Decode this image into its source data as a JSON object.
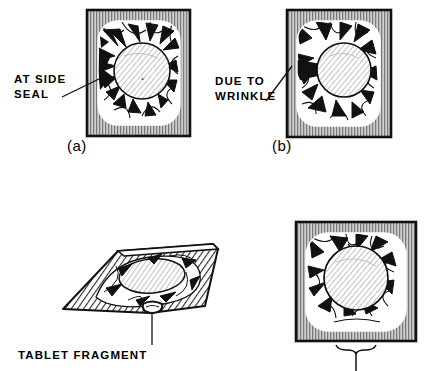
{
  "figure": {
    "background_color": "#ffffff",
    "ink_color": "#000000",
    "frame_fill": "#b0b0b0",
    "panel_inner_fill": "#ffffff",
    "type": "technical-illustration"
  },
  "panels": [
    {
      "id": "a",
      "caption": "(a)",
      "view": "face-view-blister-pack",
      "frame": "ribbed-vertical-stripe-border",
      "content": "tablet-in-pouch-with-radial-creases",
      "defect_label": "AT SIDE\nSEAL",
      "defect_label_line1": "AT SIDE",
      "defect_label_line2": "SEAL",
      "leader": "diagonal-up-right"
    },
    {
      "id": "b",
      "caption": "(b)",
      "view": "face-view-blister-pack",
      "frame": "ribbed-vertical-stripe-border",
      "content": "tablet-in-pouch-with-wrinkle-creases",
      "defect_label": "DUE TO\nWRINKLE",
      "defect_label_line1": "DUE TO",
      "defect_label_line2": "WRINKLE",
      "leader": "diagonal-up-right"
    },
    {
      "id": "c",
      "caption": "",
      "view": "perspective-flat-pouch",
      "frame": "diagonal-hatched-pouch",
      "content": "tablet-inside-pouch-with-protruding-fragment",
      "defect_label": "TABLET FRAGMENT",
      "defect_label_line1": "TABLET FRAGMENT",
      "leader": "vertical-drop"
    },
    {
      "id": "d",
      "caption": "",
      "view": "face-view-blister-pack",
      "frame": "ribbed-vertical-stripe-border",
      "content": "tablet-in-pouch-bottom-seal-callout",
      "defect_label": "",
      "leader": "brace-with-vertical-drop"
    }
  ],
  "labels": {
    "at_side_seal_line1": "AT SIDE",
    "at_side_seal_line2": "SEAL",
    "due_to_wrinkle_line1": "DUE TO",
    "due_to_wrinkle_line2": "WRINKLE",
    "tablet_fragment": "TABLET FRAGMENT",
    "caption_a": "(a)",
    "caption_b": "(b)"
  }
}
